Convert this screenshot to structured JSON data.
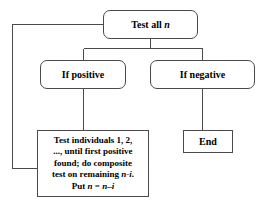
{
  "diagram": {
    "type": "flowchart",
    "background_color": "#ffffff",
    "line_color": "#4a4a4a",
    "text_color": "#000000",
    "nodes": [
      {
        "id": "test-all",
        "label": "Test all n",
        "label_prefix": "Test all ",
        "label_variable": "n",
        "shape": "rounded-rectangle"
      },
      {
        "id": "if-positive",
        "label": "If positive",
        "shape": "rounded-rectangle"
      },
      {
        "id": "if-negative",
        "label": "If negative",
        "shape": "rounded-rectangle"
      },
      {
        "id": "end",
        "label": "End",
        "shape": "rectangle"
      },
      {
        "id": "procedure",
        "shape": "rectangle",
        "lines": [
          "Test individuals 1, 2,",
          "..., until first positive",
          "found; do composite",
          "test on remaining n-i.",
          "Put n = n–i"
        ],
        "line4_prefix": "test on remaining ",
        "line4_variable": "n-i",
        "line4_suffix": ".",
        "line5_prefix": "Put ",
        "line5_var1": "n",
        "line5_middle": " = ",
        "line5_var2": "n–i"
      }
    ],
    "edges": [
      {
        "from": "test-all",
        "to": "if-positive",
        "style": "elbow"
      },
      {
        "from": "test-all",
        "to": "if-negative",
        "style": "elbow"
      },
      {
        "from": "if-positive",
        "to": "procedure",
        "style": "straight"
      },
      {
        "from": "if-negative",
        "to": "end",
        "style": "straight"
      },
      {
        "from": "procedure",
        "to": "test-all",
        "style": "feedback-loop-left"
      }
    ]
  }
}
